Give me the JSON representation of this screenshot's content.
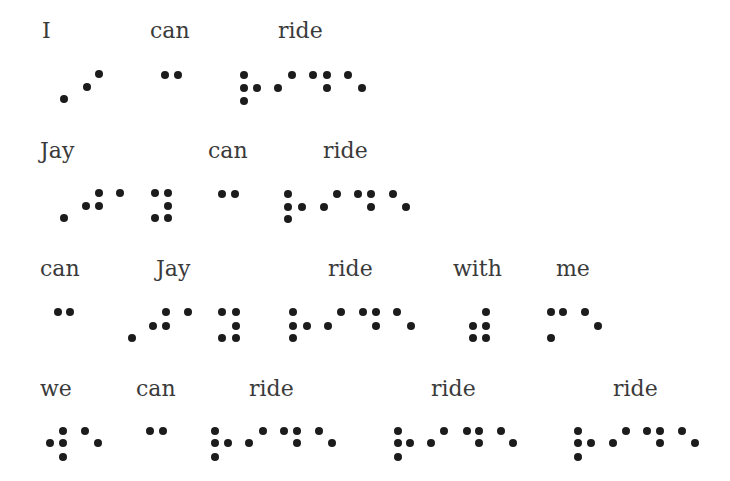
{
  "dot_color": "#1c1c1c",
  "text_color": "#3a3a3a",
  "rows": [
    {
      "words": [
        {
          "label": "I",
          "x": 42,
          "y": 20,
          "dots": [
            [
              64,
              99
            ],
            [
              87,
              87
            ],
            [
              99,
              74
            ]
          ]
        },
        {
          "label": "can",
          "x": 150,
          "y": 20,
          "dots": [
            [
              165,
              75
            ],
            [
              178,
              75
            ]
          ]
        },
        {
          "label": "ride",
          "x": 278,
          "y": 20,
          "dots": [
            [
              244,
              75
            ],
            [
              244,
              88
            ],
            [
              244,
              101
            ],
            [
              257,
              88
            ],
            [
              278,
              88
            ],
            [
              292,
              75
            ],
            [
              313,
              75
            ],
            [
              327,
              75
            ],
            [
              327,
              88
            ],
            [
              348,
              75
            ],
            [
              362,
              88
            ]
          ]
        }
      ]
    },
    {
      "words": [
        {
          "label": "Jay",
          "x": 40,
          "y": 140,
          "dots": [
            [
              64,
              218
            ],
            [
              86,
              206
            ],
            [
              99,
              206
            ],
            [
              99,
              193
            ],
            [
              120,
              193
            ],
            [
              155,
              193
            ],
            [
              168,
              193
            ],
            [
              168,
              206
            ],
            [
              155,
              218
            ],
            [
              168,
              218
            ]
          ]
        },
        {
          "label": "can",
          "x": 208,
          "y": 140,
          "dots": [
            [
              222,
              194
            ],
            [
              235,
              194
            ]
          ]
        },
        {
          "label": "ride",
          "x": 323,
          "y": 140,
          "dots": [
            [
              288,
              194
            ],
            [
              288,
              207
            ],
            [
              288,
              219
            ],
            [
              302,
              207
            ],
            [
              324,
              207
            ],
            [
              337,
              194
            ],
            [
              358,
              194
            ],
            [
              371,
              194
            ],
            [
              371,
              207
            ],
            [
              393,
              194
            ],
            [
              406,
              207
            ]
          ]
        }
      ]
    },
    {
      "words": [
        {
          "label": "can",
          "x": 40,
          "y": 258,
          "dots": [
            [
              58,
              312
            ],
            [
              70,
              312
            ]
          ]
        },
        {
          "label": "Jay",
          "x": 156,
          "y": 258,
          "dots": [
            [
              132,
              338
            ],
            [
              153,
              326
            ],
            [
              166,
              326
            ],
            [
              166,
              312
            ],
            [
              188,
              312
            ],
            [
              222,
              312
            ],
            [
              236,
              312
            ],
            [
              236,
              326
            ],
            [
              222,
              338
            ],
            [
              236,
              338
            ]
          ]
        },
        {
          "label": "ride",
          "x": 328,
          "y": 258,
          "dots": [
            [
              293,
              312
            ],
            [
              293,
              326
            ],
            [
              293,
              338
            ],
            [
              307,
              326
            ],
            [
              328,
              326
            ],
            [
              341,
              312
            ],
            [
              363,
              312
            ],
            [
              376,
              312
            ],
            [
              376,
              326
            ],
            [
              397,
              312
            ],
            [
              411,
              326
            ]
          ]
        },
        {
          "label": "with",
          "x": 453,
          "y": 258,
          "dots": [
            [
              486,
              312
            ],
            [
              473,
              326
            ],
            [
              486,
              326
            ],
            [
              473,
              338
            ],
            [
              486,
              338
            ]
          ]
        },
        {
          "label": "me",
          "x": 556,
          "y": 258,
          "dots": [
            [
              551,
              312
            ],
            [
              563,
              312
            ],
            [
              551,
              338
            ],
            [
              585,
              312
            ],
            [
              598,
              326
            ]
          ]
        }
      ]
    },
    {
      "words": [
        {
          "label": "we",
          "x": 40,
          "y": 378,
          "dots": [
            [
              50,
              443
            ],
            [
              63,
              431
            ],
            [
              63,
              443
            ],
            [
              63,
              457
            ],
            [
              85,
              431
            ],
            [
              98,
              443
            ]
          ]
        },
        {
          "label": "can",
          "x": 136,
          "y": 378,
          "dots": [
            [
              150,
              431
            ],
            [
              163,
              431
            ]
          ]
        },
        {
          "label": "ride",
          "x": 249,
          "y": 378,
          "dots": [
            [
              215,
              431
            ],
            [
              215,
              443
            ],
            [
              215,
              457
            ],
            [
              228,
              443
            ],
            [
              249,
              443
            ],
            [
              263,
              431
            ],
            [
              284,
              431
            ],
            [
              297,
              431
            ],
            [
              297,
              443
            ],
            [
              319,
              431
            ],
            [
              332,
              443
            ]
          ]
        },
        {
          "label": "ride",
          "x": 431,
          "y": 378,
          "dots": [
            [
              398,
              431
            ],
            [
              398,
              443
            ],
            [
              398,
              457
            ],
            [
              410,
              443
            ],
            [
              431,
              443
            ],
            [
              444,
              431
            ],
            [
              467,
              431
            ],
            [
              479,
              431
            ],
            [
              479,
              443
            ],
            [
              501,
              431
            ],
            [
              513,
              443
            ]
          ]
        },
        {
          "label": "ride",
          "x": 613,
          "y": 378,
          "dots": [
            [
              578,
              431
            ],
            [
              578,
              443
            ],
            [
              578,
              457
            ],
            [
              591,
              443
            ],
            [
              613,
              443
            ],
            [
              626,
              431
            ],
            [
              647,
              431
            ],
            [
              660,
              431
            ],
            [
              660,
              443
            ],
            [
              682,
              431
            ],
            [
              695,
              443
            ]
          ]
        }
      ]
    }
  ]
}
